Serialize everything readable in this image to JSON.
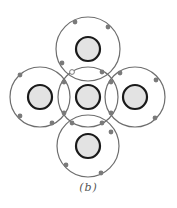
{
  "figure": {
    "caption": "(b)"
  },
  "colors": {
    "shell": "#6e6e6e",
    "nucleus_fill": "#e3e3e3",
    "nucleus_stroke": "#1a1a1a",
    "electron": "#7a7a7a",
    "shared_electron_fill": "#ffffff"
  },
  "atoms": [
    {
      "name": "top",
      "cx": 88,
      "cy": 49,
      "shell_r": 32,
      "nucleus_r": 12
    },
    {
      "name": "left",
      "cx": 40,
      "cy": 97,
      "shell_r": 30,
      "nucleus_r": 12
    },
    {
      "name": "center",
      "cx": 88,
      "cy": 97,
      "shell_r": 30,
      "nucleus_r": 12
    },
    {
      "name": "right",
      "cx": 135,
      "cy": 97,
      "shell_r": 30,
      "nucleus_r": 12
    },
    {
      "name": "bottom",
      "cx": 88,
      "cy": 146,
      "shell_r": 31,
      "nucleus_r": 12
    }
  ],
  "electrons": [
    {
      "x": 75,
      "y": 22,
      "shared": false
    },
    {
      "x": 108,
      "y": 27,
      "shared": false
    },
    {
      "x": 62,
      "y": 63,
      "shared": false
    },
    {
      "x": 20,
      "y": 75,
      "shared": false
    },
    {
      "x": 20,
      "y": 116,
      "shared": false
    },
    {
      "x": 52,
      "y": 123,
      "shared": false
    },
    {
      "x": 120,
      "y": 73,
      "shared": false
    },
    {
      "x": 156,
      "y": 80,
      "shared": false
    },
    {
      "x": 155,
      "y": 118,
      "shared": false
    },
    {
      "x": 111,
      "y": 132,
      "shared": false
    },
    {
      "x": 66,
      "y": 165,
      "shared": false
    },
    {
      "x": 101,
      "y": 173,
      "shared": false
    },
    {
      "x": 72,
      "y": 72,
      "shared": true
    },
    {
      "x": 102,
      "y": 72,
      "shared": false
    },
    {
      "x": 64,
      "y": 82,
      "shared": false
    },
    {
      "x": 64,
      "y": 113,
      "shared": false
    },
    {
      "x": 111,
      "y": 82,
      "shared": false
    },
    {
      "x": 111,
      "y": 113,
      "shared": false
    },
    {
      "x": 72,
      "y": 123,
      "shared": false
    },
    {
      "x": 102,
      "y": 123,
      "shared": false
    }
  ]
}
